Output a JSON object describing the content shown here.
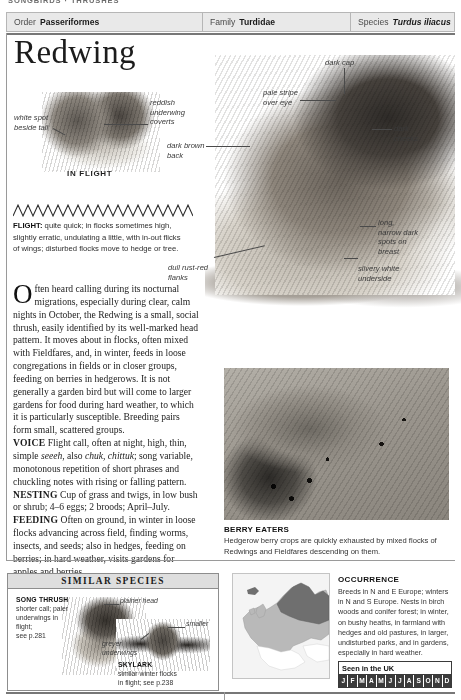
{
  "running_header": "SONGBIRDS · THRUSHES",
  "taxonomy": {
    "order_label": "Order",
    "order_value": "Passeriformes",
    "family_label": "Family",
    "family_value": "Turdidae",
    "species_label": "Species",
    "species_value": "Turdus iliacus"
  },
  "title": "Redwing",
  "callouts": {
    "white_spot": "white spot\nbeside tail",
    "reddish_coverts": "reddish\nunderwing\ncoverts",
    "in_flight": "IN FLIGHT",
    "pale_stripe": "pale stripe\nover eye",
    "dark_cap": "dark cap",
    "dark_cheeks": "dark\ncheeks",
    "dark_brown_back": "dark brown\nback",
    "long_spots": "long,\nnarrow dark\nspots on\nbreast",
    "silvery_underside": "silvery white\nunderside",
    "dull_flanks": "dull rust-red\nflanks"
  },
  "flight": {
    "heading": "FLIGHT:",
    "text": " quite quick; in flocks sometimes high, slightly erratic, undulating a little, with in-out flicks of wings; disturbed flocks move to hedge or tree."
  },
  "body": {
    "dropcap": "O",
    "intro": "ften heard calling during its nocturnal migrations, especially during clear, calm nights in October, the Redwing is a small, social thrush, easily identified by its well-marked head pattern. It moves about in flocks, often mixed with Fieldfares, and, in winter, feeds in loose congregations in fields or in closer groups, feeding on berries in hedgerows. It is not generally a garden bird but will come to larger gardens for food during hard weather, to which it is particularly susceptible. Breeding pairs form small, scattered groups.",
    "voice_head": "VOICE",
    "voice_a": " Flight call, often at night, high, thin, simple ",
    "voice_i1": "seeeh",
    "voice_b": ", also ",
    "voice_i2": "chuk, chittuk",
    "voice_c": "; song variable, monotonous repetition of short phrases and chuckling notes with rising or falling pattern.",
    "nesting_head": "NESTING",
    "nesting_text": " Cup of grass and twigs, in low bush or shrub; 4–6 eggs; 2 broods; April–July.",
    "feeding_head": "FEEDING",
    "feeding_text": " Often on ground, in winter in loose flocks advancing across field, finding worms, insects, and seeds; also in hedges, feeding on berries; in hard weather, visits gardens for apples and berries."
  },
  "berry_caption": {
    "title": "BERRY EATERS",
    "text": "Hedgerow berry crops are quickly exhausted by mixed flocks of Redwings and Fieldfares descending on them."
  },
  "similar_species": {
    "heading": "SIMILAR SPECIES",
    "song_thrush_name": "SONG THRUSH",
    "song_thrush_desc": "shorter call; paler\nunderwings in\nflight;\nsee p.281",
    "plainer_head": "plainer head",
    "smaller": "smaller",
    "greyer_underwings": "greyer\nunderwings",
    "skylark_name": "SKYLARK",
    "skylark_desc": "similar winter flocks\nin flight; see p.238"
  },
  "occurrence": {
    "title": "OCCURRENCE",
    "text": "Breeds in N and E Europe; winters in N and S Europe. Nests in birch woods and conifer forest; in winter, on bushy heaths, in farmland with hedges and old pastures, in larger, undisturbed parks, and in gardens, especially in hard weather.",
    "seen_label": "Seen in the UK",
    "months": [
      {
        "label": "J",
        "present": true
      },
      {
        "label": "F",
        "present": true
      },
      {
        "label": "M",
        "present": true
      },
      {
        "label": "A",
        "present": true
      },
      {
        "label": "M",
        "present": true
      },
      {
        "label": "J",
        "present": true
      },
      {
        "label": "J",
        "present": true
      },
      {
        "label": "A",
        "present": true
      },
      {
        "label": "S",
        "present": true
      },
      {
        "label": "O",
        "present": true
      },
      {
        "label": "N",
        "present": true
      },
      {
        "label": "D",
        "present": true
      }
    ]
  },
  "colors": {
    "rule": "#777777",
    "panel_header": "#dedede",
    "taxo_bar": "#e9e9e9",
    "month_on": "#3b3b3b",
    "map_breeding": "#6f6f6f",
    "map_winter": "#b9b9b9"
  }
}
